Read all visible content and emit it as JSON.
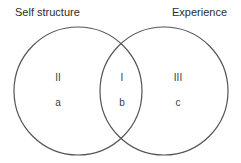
{
  "diagram": {
    "type": "venn",
    "stroke_color": "#555555",
    "sets": [
      {
        "id": "self_structure",
        "label": "Self structure",
        "center": [
          78,
          91
        ],
        "radius": 64
      },
      {
        "id": "experience",
        "label": "Experience",
        "center": [
          164,
          91
        ],
        "radius": 64
      }
    ],
    "regions": [
      {
        "numeral": "II",
        "letter": "a",
        "description": "Self structure only"
      },
      {
        "numeral": "I",
        "letter": "b",
        "description": "Overlap"
      },
      {
        "numeral": "III",
        "letter": "c",
        "description": "Experience only"
      }
    ]
  }
}
